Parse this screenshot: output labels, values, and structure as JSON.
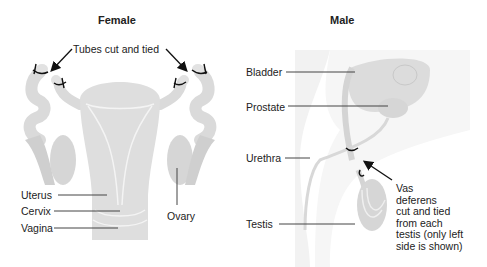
{
  "female": {
    "title": "Female",
    "labels": {
      "tubes": "Tubes cut and tied",
      "uterus": "Uterus",
      "cervix": "Cervix",
      "vagina": "Vagina",
      "ovary": "Ovary"
    }
  },
  "male": {
    "title": "Male",
    "labels": {
      "bladder": "Bladder",
      "prostate": "Prostate",
      "urethra": "Urethra",
      "testis": "Testis"
    },
    "vas_note": [
      "Vas",
      "deferens",
      "cut and tied",
      "from each",
      "testis (only left",
      "side is shown)"
    ]
  },
  "colors": {
    "tissue": "#dcdcdc",
    "tissue_dark": "#c8c8c8",
    "background_shade": "#f0f0f0",
    "leader_line": "#333333"
  }
}
